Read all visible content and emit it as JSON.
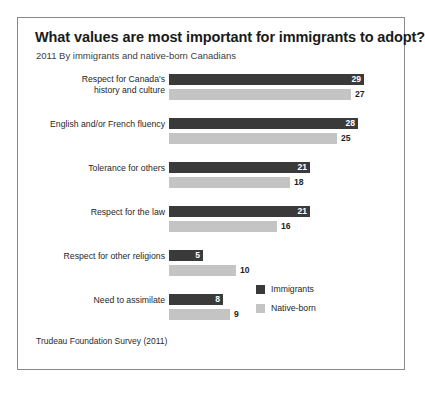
{
  "chart_data": {
    "type": "bar",
    "title": "What values are most important for immigrants to adopt?",
    "subtitle": "2011  By immigrants and native-born Canadians",
    "source": "Trudeau Foundation Survey (2011)",
    "orientation": "horizontal",
    "xlabel": "",
    "ylabel": "",
    "xlim": [
      0,
      30
    ],
    "grid": false,
    "legend_position": "inside-right",
    "categories": [
      "Respect for Canada's history and culture",
      "English and/or French fluency",
      "Tolerance for others",
      "Respect for the law",
      "Respect for other religions",
      "Need to assimilate"
    ],
    "category_lines": [
      [
        "Respect for Canada's",
        "history and culture"
      ],
      [
        "English and/or French fluency"
      ],
      [
        "Tolerance for others"
      ],
      [
        "Respect for the law"
      ],
      [
        "Respect for other religions"
      ],
      [
        "Need to assimilate"
      ]
    ],
    "series": [
      {
        "name": "Immigrants",
        "color": "#3a3a3a",
        "values": [
          29,
          28,
          21,
          21,
          5,
          8
        ]
      },
      {
        "name": "Native-born",
        "color": "#c4c4c4",
        "values": [
          27,
          25,
          18,
          16,
          10,
          9
        ]
      }
    ]
  },
  "legend": {
    "items": [
      {
        "label": "Immigrants",
        "tone": "dark"
      },
      {
        "label": "Native-born",
        "tone": "light"
      }
    ]
  }
}
